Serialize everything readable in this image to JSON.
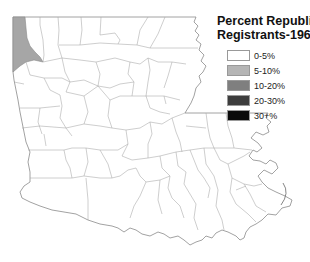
{
  "legend": {
    "title_line1": "Percent Republican",
    "title_line2": "Registrants-1966",
    "items": [
      {
        "label": "0-5%",
        "color": "#ffffff"
      },
      {
        "label": "5-10%",
        "color": "#b5b5b5"
      },
      {
        "label": "10-20%",
        "color": "#7f7f7f"
      },
      {
        "label": "20-30%",
        "color": "#3d3d3d"
      },
      {
        "label": "30+%",
        "color": "#0a0a0a"
      }
    ]
  },
  "map": {
    "region": "Louisiana parishes",
    "highlighted_parishes": [
      {
        "name": "Caddo",
        "category": "5-10%",
        "color": "#a6a6a6"
      }
    ],
    "default_category": "0-5%",
    "default_color": "#ffffff"
  }
}
